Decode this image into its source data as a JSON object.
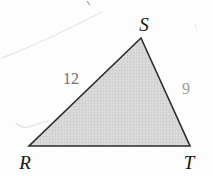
{
  "diagram": {
    "type": "triangle",
    "triangle_points": "141,38 29,146 190,146",
    "vertices": [
      {
        "id": "S",
        "label": "S",
        "position": "top"
      },
      {
        "id": "R",
        "label": "R",
        "position": "bottom-left"
      },
      {
        "id": "T",
        "label": "T",
        "position": "bottom-right"
      }
    ],
    "sides": [
      {
        "from": "R",
        "to": "S",
        "length_label": "12"
      },
      {
        "from": "S",
        "to": "T",
        "length_label": "9"
      },
      {
        "from": "R",
        "to": "T",
        "length_label": ""
      }
    ],
    "colors": {
      "fill": "#dadada",
      "fill_dot": "#c7c7c7",
      "stroke": "#2b2b2b",
      "vertex_label": "#141414",
      "side_label_rs": "#6f6f6f",
      "side_label_st": "#9a9a9a",
      "background": "#fdfdfd"
    }
  }
}
